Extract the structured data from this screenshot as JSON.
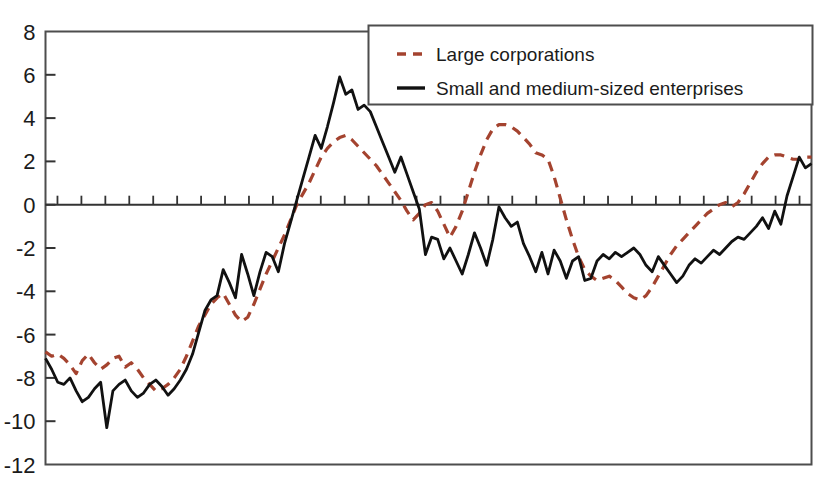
{
  "chart_data": {
    "type": "line",
    "title": "",
    "subtitle": "",
    "xlabel": "",
    "ylabel": "",
    "ylim": [
      -12,
      8
    ],
    "yticks": [
      8,
      6,
      4,
      2,
      0,
      -2,
      -4,
      -6,
      -8,
      -10,
      -12
    ],
    "ytick_labels": [
      "8",
      "6",
      "4",
      "2",
      "0",
      "-2",
      "-4",
      "-6",
      "-8",
      "-10",
      "-12"
    ],
    "xlim": [
      0,
      125
    ],
    "xticks_count": 32,
    "xtick_labels": [],
    "grid": false,
    "zero_line": true,
    "legend": {
      "position": "upper-right-inset",
      "entries": [
        {
          "name": "Large corporations",
          "style": "dashed",
          "color": "#a4432f"
        },
        {
          "name": "Small and medium-sized enterprises",
          "style": "solid",
          "color": "#111111"
        }
      ]
    },
    "series": [
      {
        "name": "Large corporations",
        "style": "dashed",
        "color": "#a4432f",
        "values": [
          -6.8,
          -7.0,
          -6.9,
          -7.1,
          -7.4,
          -7.8,
          -7.2,
          -6.9,
          -7.3,
          -7.6,
          -7.4,
          -7.1,
          -7.0,
          -7.5,
          -7.3,
          -7.6,
          -8.0,
          -8.3,
          -8.6,
          -8.5,
          -8.3,
          -8.0,
          -7.6,
          -7.0,
          -6.3,
          -5.6,
          -5.1,
          -4.6,
          -4.3,
          -4.1,
          -4.6,
          -5.1,
          -5.4,
          -5.2,
          -4.6,
          -3.9,
          -3.2,
          -2.6,
          -2.0,
          -1.4,
          -0.7,
          0.0,
          0.5,
          1.0,
          1.6,
          2.2,
          2.6,
          2.9,
          3.1,
          3.2,
          3.0,
          2.7,
          2.4,
          2.1,
          1.8,
          1.4,
          1.0,
          0.6,
          0.2,
          -0.3,
          -0.7,
          -0.4,
          0.0,
          0.1,
          -0.3,
          -0.9,
          -1.5,
          -1.0,
          -0.3,
          0.6,
          1.5,
          2.3,
          3.0,
          3.5,
          3.7,
          3.7,
          3.6,
          3.4,
          3.1,
          2.8,
          2.4,
          2.3,
          2.1,
          1.3,
          0.3,
          -0.7,
          -1.6,
          -2.4,
          -3.0,
          -3.3,
          -3.5,
          -3.4,
          -3.3,
          -3.5,
          -3.8,
          -4.1,
          -4.3,
          -4.4,
          -4.2,
          -3.8,
          -3.3,
          -2.8,
          -2.3,
          -1.9,
          -1.6,
          -1.3,
          -1.0,
          -0.7,
          -0.4,
          -0.2,
          0.0,
          0.1,
          -0.1,
          0.1,
          0.5,
          1.0,
          1.5,
          1.9,
          2.2,
          2.3,
          2.3,
          2.2,
          2.1,
          2.1,
          2.2,
          2.2
        ]
      },
      {
        "name": "Small and medium-sized enterprises",
        "style": "solid",
        "color": "#111111",
        "values": [
          -7.1,
          -7.6,
          -8.2,
          -8.3,
          -8.0,
          -8.6,
          -9.1,
          -8.9,
          -8.5,
          -8.2,
          -10.3,
          -8.6,
          -8.3,
          -8.1,
          -8.6,
          -8.9,
          -8.7,
          -8.3,
          -8.1,
          -8.4,
          -8.8,
          -8.5,
          -8.1,
          -7.6,
          -6.9,
          -5.9,
          -4.9,
          -4.4,
          -4.2,
          -3.0,
          -3.6,
          -4.3,
          -2.3,
          -3.2,
          -4.2,
          -3.1,
          -2.2,
          -2.4,
          -3.1,
          -1.8,
          -0.8,
          0.2,
          1.2,
          2.2,
          3.2,
          2.6,
          3.6,
          4.7,
          5.9,
          5.1,
          5.3,
          4.4,
          4.6,
          4.3,
          3.6,
          2.9,
          2.2,
          1.5,
          2.2,
          1.4,
          0.6,
          -0.2,
          -2.3,
          -1.5,
          -1.6,
          -2.5,
          -2.0,
          -2.6,
          -3.2,
          -2.3,
          -1.3,
          -2.0,
          -2.8,
          -1.6,
          -0.1,
          -0.6,
          -1.0,
          -0.8,
          -1.8,
          -2.4,
          -3.1,
          -2.2,
          -3.2,
          -2.1,
          -2.6,
          -3.4,
          -2.6,
          -2.4,
          -3.5,
          -3.4,
          -2.6,
          -2.3,
          -2.5,
          -2.2,
          -2.4,
          -2.2,
          -2.0,
          -2.3,
          -2.8,
          -3.1,
          -2.4,
          -2.8,
          -3.2,
          -3.6,
          -3.3,
          -2.8,
          -2.5,
          -2.7,
          -2.4,
          -2.1,
          -2.3,
          -2.0,
          -1.7,
          -1.5,
          -1.6,
          -1.3,
          -1.0,
          -0.6,
          -1.1,
          -0.3,
          -0.9,
          0.4,
          1.3,
          2.2,
          1.7,
          1.9
        ]
      }
    ]
  },
  "axis": {
    "frame_color": "#4d4d4d",
    "tick_color": "#333333"
  }
}
